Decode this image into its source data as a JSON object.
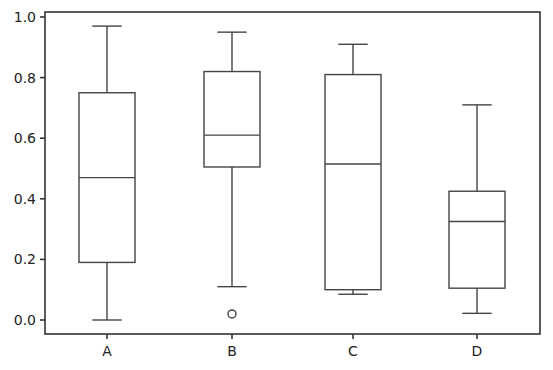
{
  "chart_data": {
    "type": "box",
    "title": "",
    "xlabel": "",
    "ylabel": "",
    "categories": [
      "A",
      "B",
      "C",
      "D"
    ],
    "ylim": [
      -0.04,
      1.02
    ],
    "yticks": [
      0.0,
      0.2,
      0.4,
      0.6,
      0.8,
      1.0
    ],
    "ytick_labels": [
      "0.0",
      "0.2",
      "0.4",
      "0.6",
      "0.8",
      "1.0"
    ],
    "grid": false,
    "legend": "none",
    "boxes": [
      {
        "name": "A",
        "whisker_low": 0.0,
        "q1": 0.19,
        "median": 0.47,
        "q3": 0.75,
        "whisker_high": 0.97,
        "outliers": []
      },
      {
        "name": "B",
        "whisker_low": 0.11,
        "q1": 0.505,
        "median": 0.61,
        "q3": 0.82,
        "whisker_high": 0.95,
        "outliers": [
          0.02
        ]
      },
      {
        "name": "C",
        "whisker_low": 0.085,
        "q1": 0.1,
        "median": 0.515,
        "q3": 0.81,
        "whisker_high": 0.91,
        "outliers": []
      },
      {
        "name": "D",
        "whisker_low": 0.022,
        "q1": 0.105,
        "median": 0.325,
        "q3": 0.425,
        "whisker_high": 0.71,
        "outliers": []
      }
    ]
  },
  "colors": {
    "box_stroke": "#444444",
    "axis": "#333333",
    "background": "#ffffff"
  }
}
